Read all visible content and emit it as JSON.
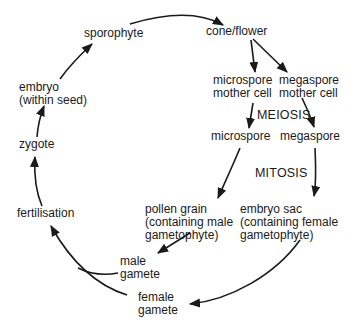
{
  "diagram": {
    "title": "",
    "type": "life-cycle",
    "colors": {
      "ink": "#1a1a1a",
      "background": "#ffffff"
    },
    "nodes": {
      "sporophyte": "sporophyte",
      "cone_flower": "cone/flower",
      "microspore_mother_cell": "microspore\nmother cell",
      "megaspore_mother_cell": "megaspore\nmother cell",
      "meiosis": "MEIOSIS",
      "microspore": "microspore",
      "megaspore": "megaspore",
      "mitosis": "MITOSIS",
      "pollen_grain": "pollen grain\n(containing male\ngametophyte)",
      "embryo_sac": "embryo sac\n(containing female\ngametophyte)",
      "male_gamete": "male\ngamete",
      "female_gamete": "female\ngamete",
      "fertilisation": "fertilisation",
      "zygote": "zygote",
      "embryo": "embryo\n(within seed)"
    },
    "edges": [
      [
        "sporophyte",
        "cone_flower"
      ],
      [
        "cone_flower",
        "microspore_mother_cell"
      ],
      [
        "cone_flower",
        "megaspore_mother_cell"
      ],
      [
        "microspore_mother_cell",
        "microspore"
      ],
      [
        "megaspore_mother_cell",
        "megaspore"
      ],
      [
        "microspore",
        "pollen_grain"
      ],
      [
        "megaspore",
        "embryo_sac"
      ],
      [
        "pollen_grain",
        "male_gamete"
      ],
      [
        "embryo_sac",
        "female_gamete"
      ],
      [
        "male_gamete",
        "fertilisation"
      ],
      [
        "female_gamete",
        "fertilisation"
      ],
      [
        "fertilisation",
        "zygote"
      ],
      [
        "zygote",
        "embryo"
      ],
      [
        "embryo",
        "sporophyte"
      ]
    ]
  }
}
